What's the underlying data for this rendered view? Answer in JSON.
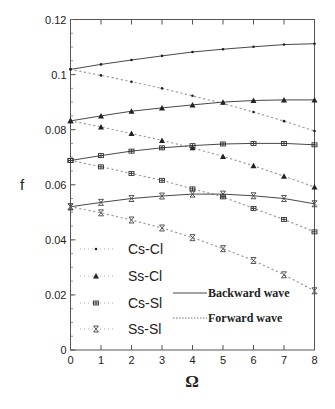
{
  "chart_data": {
    "type": "line",
    "title": "",
    "xlabel": "Ω",
    "ylabel": "f",
    "xlim": [
      0,
      8
    ],
    "ylim": [
      0,
      0.12
    ],
    "x": [
      0,
      1,
      2,
      3,
      4,
      5,
      6,
      7,
      8
    ],
    "xticks": [
      "0",
      "1",
      "2",
      "3",
      "4",
      "5",
      "6",
      "7",
      "8"
    ],
    "yticks": [
      "0",
      "0.02",
      "0.04",
      "0.06",
      "0.08",
      "0.1",
      "0.12"
    ],
    "ytick_values": [
      0,
      0.02,
      0.04,
      0.06,
      0.08,
      0.1,
      0.12
    ],
    "grid": false,
    "series": [
      {
        "name": "Cs-Cl",
        "wave": "Backward wave",
        "marker": "dot",
        "values": [
          0.1019,
          0.1037,
          0.1053,
          0.1068,
          0.1082,
          0.1092,
          0.1101,
          0.1109,
          0.1112
        ]
      },
      {
        "name": "Cs-Cl",
        "wave": "Forward wave",
        "marker": "dot",
        "values": [
          0.1019,
          0.0997,
          0.0974,
          0.095,
          0.0923,
          0.0895,
          0.0864,
          0.0831,
          0.0795
        ]
      },
      {
        "name": "Ss-Cl",
        "wave": "Backward wave",
        "marker": "triangle",
        "values": [
          0.0832,
          0.085,
          0.0867,
          0.0879,
          0.089,
          0.09,
          0.0906,
          0.0908,
          0.0908
        ]
      },
      {
        "name": "Ss-Cl",
        "wave": "Forward wave",
        "marker": "triangle",
        "values": [
          0.0832,
          0.081,
          0.0786,
          0.0761,
          0.0734,
          0.0703,
          0.0669,
          0.0631,
          0.0592
        ]
      },
      {
        "name": "Cs-Sl",
        "wave": "Backward wave",
        "marker": "asterisk-box",
        "values": [
          0.0688,
          0.0706,
          0.0722,
          0.0734,
          0.0742,
          0.0748,
          0.075,
          0.075,
          0.0745
        ]
      },
      {
        "name": "Cs-Sl",
        "wave": "Forward wave",
        "marker": "asterisk-box",
        "values": [
          0.0688,
          0.0665,
          0.0641,
          0.0616,
          0.0585,
          0.0556,
          0.0514,
          0.0474,
          0.0429
        ]
      },
      {
        "name": "Ss-Sl",
        "wave": "Backward wave",
        "marker": "hourglass",
        "values": [
          0.052,
          0.0536,
          0.055,
          0.0559,
          0.0566,
          0.0566,
          0.056,
          0.055,
          0.0531
        ]
      },
      {
        "name": "Ss-Sl",
        "wave": "Forward wave",
        "marker": "hourglass",
        "values": [
          0.052,
          0.0498,
          0.0472,
          0.0443,
          0.0408,
          0.0368,
          0.0325,
          0.0273,
          0.0215
        ]
      }
    ],
    "legend": {
      "placement": "bottom-left",
      "markers": [
        {
          "label": "Cs-Cl",
          "marker": "dot"
        },
        {
          "label": "Ss-Cl",
          "marker": "triangle"
        },
        {
          "label": "Cs-Sl",
          "marker": "asterisk-box"
        },
        {
          "label": "Ss-Sl",
          "marker": "hourglass"
        }
      ],
      "lines": [
        {
          "label": "Backward wave",
          "style": "solid"
        },
        {
          "label": "Forward wave",
          "style": "dotted"
        }
      ]
    }
  }
}
